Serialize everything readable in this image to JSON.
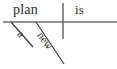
{
  "diagram": {
    "type": "reed-kellogg-sentence-diagram",
    "sentence": "A new plan is",
    "ink_color": "#2b2b2b",
    "baseline_color": "#6f6f6f",
    "background_color": "#ffffff",
    "labels": {
      "subject": "plan",
      "verb": "is",
      "article_modifier": "a",
      "adjective_modifier": "new"
    },
    "lines": {
      "baseline": {
        "x1": 3,
        "y1": 22,
        "x2": 117,
        "y2": 22
      },
      "subject_verb_divider": {
        "x1": 63,
        "y1": 3,
        "x2": 63,
        "y2": 39
      },
      "article_slant": {
        "x1": 11,
        "y1": 22,
        "x2": 33,
        "y2": 47
      },
      "adjective_slant": {
        "x1": 36,
        "y1": 22,
        "x2": 64,
        "y2": 64
      }
    }
  }
}
